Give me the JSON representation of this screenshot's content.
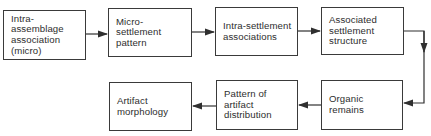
{
  "diagram": {
    "type": "flowchart",
    "colors": {
      "line": "#2f2f2f",
      "text": "#2e2e2e",
      "background": "#ffffff"
    },
    "nodes": [
      {
        "id": "n1",
        "label": "Intra-assemblage association (micro)",
        "lines": [
          "Intra-assemblage",
          "association",
          "(micro)"
        ]
      },
      {
        "id": "n2",
        "label": "Micro-settlement pattern",
        "lines": [
          "Micro-settlement",
          "pattern"
        ]
      },
      {
        "id": "n3",
        "label": "Intra-settlement associations",
        "lines": [
          "Intra-settlement",
          "associations"
        ]
      },
      {
        "id": "n4",
        "label": "Associated settlement structure",
        "lines": [
          "Associated",
          "settlement",
          "structure"
        ]
      },
      {
        "id": "n5",
        "label": "Organic remains",
        "lines": [
          "Organic",
          "remains"
        ]
      },
      {
        "id": "n6",
        "label": "Pattern of artifact distribution",
        "lines": [
          "Pattern of",
          "artifact",
          "distribution"
        ]
      },
      {
        "id": "n7",
        "label": "Artifact morphology",
        "lines": [
          "Artifact",
          "morphology"
        ]
      }
    ],
    "edges": [
      {
        "from": "n1",
        "to": "n2"
      },
      {
        "from": "n2",
        "to": "n3"
      },
      {
        "from": "n3",
        "to": "n4"
      },
      {
        "from": "n4",
        "to": "n5"
      },
      {
        "from": "n5",
        "to": "n6"
      },
      {
        "from": "n6",
        "to": "n7"
      }
    ]
  }
}
